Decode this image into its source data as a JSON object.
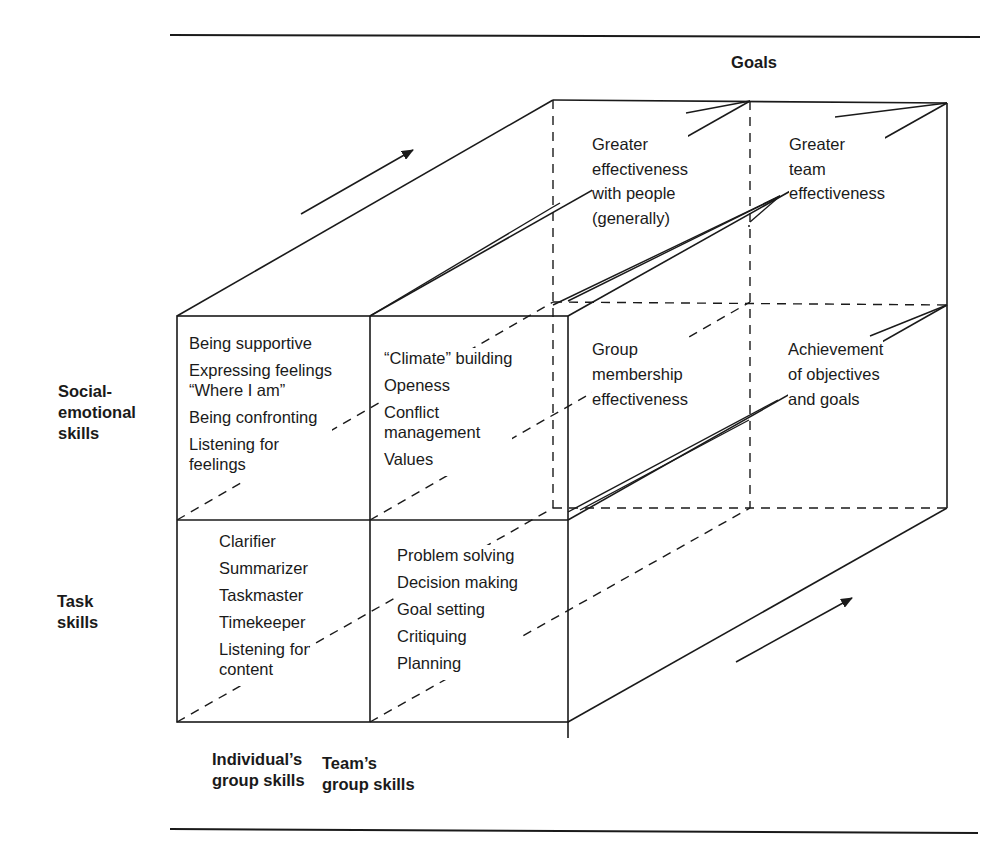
{
  "title": "Goals",
  "row_labels": {
    "social_emotional": "Social-\nemotional\nskills",
    "task": "Task\nskills"
  },
  "column_labels": {
    "individual": "Individual’s\ngroup skills",
    "team": "Team’s\ngroup skills"
  },
  "cells": {
    "individual_social": [
      "Being supportive",
      "Expressing feelings\n“Where I am”",
      "Being confronting",
      "Listening for\nfeelings"
    ],
    "team_social": [
      "“Climate” building",
      "Openess",
      "Conflict\nmanagement",
      "Values"
    ],
    "individual_task": [
      "Clarifier",
      "Summarizer",
      "Taskmaster",
      "Timekeeper",
      "Listening for\ncontent"
    ],
    "team_task": [
      "Problem solving",
      "Decision making",
      "Goal setting",
      "Critiquing",
      "Planning"
    ]
  },
  "goals": {
    "top_left": "Greater\neffectiveness\nwith people\n(generally)",
    "top_right": "Greater\nteam\neffectiveness",
    "front_left": "Group\nmembership\neffectiveness",
    "front_right": "Achievement\nof objectives\nand goals"
  },
  "colors": {
    "line": "#1a1a1a",
    "background": "#ffffff"
  }
}
